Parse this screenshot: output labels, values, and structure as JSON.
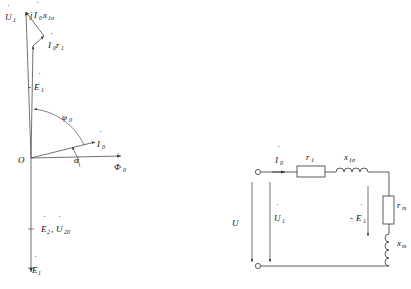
{
  "figure": {
    "kind": "transformer-no-load-phasor-and-equivalent-circuit",
    "background_color": "#ffffff",
    "line_color": "#333333",
    "text_color": "#111111"
  },
  "phasor_diagram": {
    "origin_label": "O",
    "labels": {
      "u1": "U",
      "u1_sub": "1",
      "jx": "j",
      "jx_i": "I",
      "jx_i_sub": "0",
      "jx_x": "x",
      "jx_x_sub": "1σ",
      "ir": "I",
      "ir_sub": "0",
      "ir_r": "r",
      "ir_r_sub": "1",
      "minus_e1_pre": "-",
      "minus_e1": "E",
      "minus_e1_sub": "1",
      "phi0": "φ",
      "phi0_sub": "0",
      "i0": "I",
      "i0_sub": "0",
      "alpha": "α",
      "flux": "Φ",
      "flux_sub": "0",
      "e2": "E",
      "e2_sub": "2",
      "u20": "U",
      "u20_sub": "20",
      "e1": "E",
      "e1_sub": "1",
      "comma": ","
    }
  },
  "circuit_diagram": {
    "labels": {
      "i0": "I",
      "i0_sub": "0",
      "r1": "r",
      "r1_sub": "1",
      "x1s": "x",
      "x1s_sub": "1σ",
      "rm": "r",
      "rm_sub": "m",
      "xm": "x",
      "xm_sub": "m",
      "u": "U",
      "u1": "U",
      "u1_sub": "1",
      "minus_e1_pre": "-",
      "minus_e1": "E",
      "minus_e1_sub": "1"
    }
  }
}
